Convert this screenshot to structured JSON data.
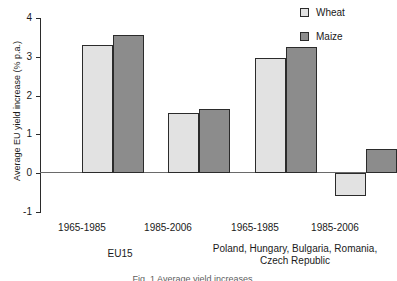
{
  "chart_data": {
    "type": "bar",
    "title": "",
    "xlabel": "",
    "ylabel": "Average EU yield increase (% p.a.)",
    "ylim": [
      -1,
      4
    ],
    "yticks": [
      -1,
      0,
      1,
      2,
      3,
      4
    ],
    "ytick_labels": [
      "-1",
      "0",
      "1",
      "2",
      "3",
      "4"
    ],
    "grid": false,
    "legend_position": "top-right",
    "categories": [
      "1965-1985",
      "1985-2006",
      "1965-1985",
      "1985-2006"
    ],
    "groups": [
      {
        "label": "EU15",
        "categories": [
          "1965-1985",
          "1985-2006"
        ]
      },
      {
        "label": "Poland, Hungary, Bulgaria,\nRomania, Czech Republic",
        "categories": [
          "1965-1985",
          "1985-2006"
        ]
      }
    ],
    "series": [
      {
        "name": "Wheat",
        "color": "#e2e2e2",
        "values": [
          3.3,
          1.55,
          2.98,
          -0.6
        ]
      },
      {
        "name": "Maize",
        "color": "#8c8c8c",
        "values": [
          3.55,
          1.65,
          3.25,
          0.62
        ]
      }
    ]
  },
  "legend": {
    "items": [
      {
        "label": "Wheat",
        "swatch": "wheat"
      },
      {
        "label": "Maize",
        "swatch": "maize"
      }
    ]
  },
  "axis": {
    "y_label": "Average EU yield increase (% p.a.)",
    "y_ticks": [
      "4",
      "3",
      "2",
      "1",
      "0",
      "-1"
    ]
  },
  "categories": [
    {
      "label": "1965-1985"
    },
    {
      "label": "1985-2006"
    },
    {
      "label": "1965-1985"
    },
    {
      "label": "1985-2006"
    }
  ],
  "group_labels": [
    {
      "text": "EU15"
    },
    {
      "text": "Poland, Hungary, Bulgaria, Romania, Czech Republic"
    }
  ],
  "caption": {
    "text": "Fig. 1 Average yield increases"
  }
}
